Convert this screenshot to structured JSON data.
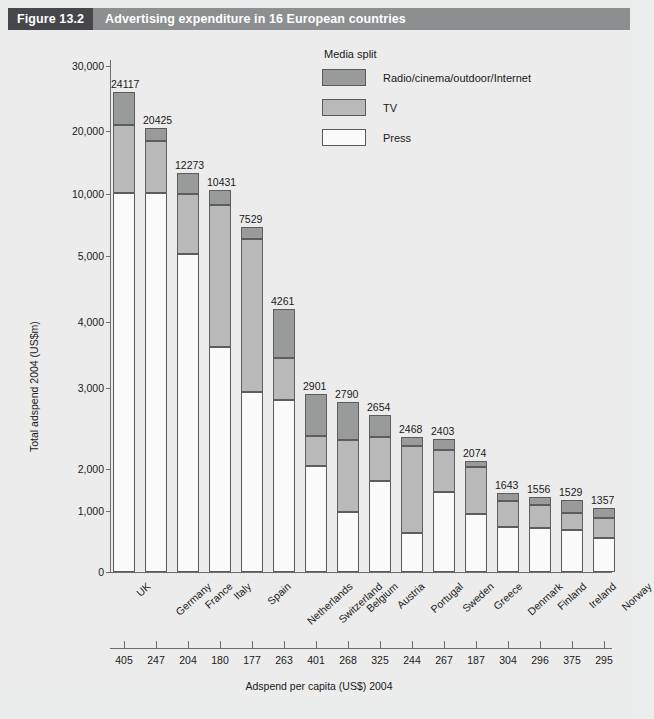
{
  "header": {
    "figure_number": "Figure 13.2",
    "title": "Advertising expenditure in 16 European countries"
  },
  "legend": {
    "title": "Media split",
    "items": [
      {
        "label": "Radio/cinema/outdoor/Internet",
        "color": "#999a9a",
        "key": "radio"
      },
      {
        "label": "TV",
        "color": "#b9b9b9",
        "key": "tv"
      },
      {
        "label": "Press",
        "color": "#fbfbfb",
        "key": "press"
      }
    ]
  },
  "axes": {
    "y_title": "Total adspend 2004 (US$m)",
    "y_ticks": [
      "30,000",
      "20,000",
      "10,000",
      "5,000",
      "4,000",
      "3,000",
      "2,000",
      "1,000",
      "0"
    ],
    "y_tick_values": [
      30000,
      20000,
      10000,
      5000,
      4000,
      3000,
      2000,
      1000,
      0
    ],
    "bottom_title": "Adspend per capita (US$) 2004"
  },
  "chart_data": {
    "type": "bar",
    "stacked": true,
    "title": "Advertising expenditure in 16 European countries",
    "xlabel": "Adspend per capita (US$) 2004",
    "ylabel": "Total adspend 2004 (US$m)",
    "yscale": "log-like (custom piecewise)",
    "ylim": [
      0,
      30000
    ],
    "grid": false,
    "legend_position": "top-right",
    "categories": [
      "UK",
      "Germany",
      "France",
      "Italy",
      "Spain",
      "Netherlands",
      "Switzerland",
      "Belgium",
      "Austria",
      "Portugal",
      "Sweden",
      "Greece",
      "Denmark",
      "Finland",
      "Ireland",
      "Norway"
    ],
    "totals": [
      24117,
      20425,
      12273,
      10431,
      7529,
      4261,
      2901,
      2790,
      2654,
      2468,
      2403,
      2074,
      1643,
      1556,
      1529,
      1357
    ],
    "adspend_per_capita": [
      405,
      247,
      204,
      180,
      177,
      263,
      401,
      268,
      325,
      244,
      267,
      187,
      304,
      296,
      375,
      295
    ],
    "series": [
      {
        "name": "Press",
        "key": "press",
        "color": "#fbfbfb",
        "values": [
          12000,
          11700,
          5250,
          3600,
          2800,
          2600,
          1700,
          1000,
          1430,
          640,
          1300,
          980,
          740,
          780,
          700,
          570
        ]
      },
      {
        "name": "TV",
        "key": "tv",
        "color": "#b9b9b9",
        "values": [
          5800,
          5600,
          4400,
          5300,
          3800,
          920,
          620,
          1320,
          730,
          1720,
          740,
          930,
          680,
          570,
          540,
          620
        ]
      },
      {
        "name": "Radio/cinema/outdoor/Internet",
        "key": "radio",
        "color": "#999a9a",
        "values": [
          6317,
          3125,
          2623,
          1531,
          929,
          741,
          581,
          470,
          494,
          108,
          363,
          164,
          223,
          206,
          289,
          167
        ]
      }
    ]
  },
  "bars": [
    {
      "country": "UK",
      "total_label": "24117",
      "per_capita": "405",
      "geom": {
        "left": 113,
        "width": 22,
        "press_top": 193,
        "tv_top": 125,
        "radio_top": 92
      }
    },
    {
      "country": "Germany",
      "total_label": "20425",
      "per_capita": "247",
      "geom": {
        "left": 145,
        "width": 22,
        "press_top": 193,
        "tv_top": 141,
        "radio_top": 128
      }
    },
    {
      "country": "France",
      "total_label": "12273",
      "per_capita": "204",
      "geom": {
        "left": 177,
        "width": 22,
        "press_top": 254,
        "tv_top": 194,
        "radio_top": 173
      }
    },
    {
      "country": "Italy",
      "total_label": "10431",
      "per_capita": "180",
      "geom": {
        "left": 209,
        "width": 22,
        "press_top": 347,
        "tv_top": 205,
        "radio_top": 190
      }
    },
    {
      "country": "Spain",
      "total_label": "7529",
      "per_capita": "177",
      "geom": {
        "left": 241,
        "width": 22,
        "press_top": 392,
        "tv_top": 239,
        "radio_top": 227
      }
    },
    {
      "country": "Netherlands",
      "total_label": "4261",
      "per_capita": "263",
      "geom": {
        "left": 273,
        "width": 22,
        "press_top": 400,
        "tv_top": 358,
        "radio_top": 309
      }
    },
    {
      "country": "Switzerland",
      "total_label": "2901",
      "per_capita": "401",
      "geom": {
        "left": 305,
        "width": 22,
        "press_top": 466,
        "tv_top": 436,
        "radio_top": 394
      }
    },
    {
      "country": "Belgium",
      "total_label": "2790",
      "per_capita": "268",
      "geom": {
        "left": 337,
        "width": 22,
        "press_top": 512,
        "tv_top": 440,
        "radio_top": 402
      }
    },
    {
      "country": "Austria",
      "total_label": "2654",
      "per_capita": "325",
      "geom": {
        "left": 369,
        "width": 22,
        "press_top": 481,
        "tv_top": 437,
        "radio_top": 415
      }
    },
    {
      "country": "Portugal",
      "total_label": "2468",
      "per_capita": "244",
      "geom": {
        "left": 401,
        "width": 22,
        "press_top": 533,
        "tv_top": 446,
        "radio_top": 437
      }
    },
    {
      "country": "Sweden",
      "total_label": "2403",
      "per_capita": "267",
      "geom": {
        "left": 433,
        "width": 22,
        "press_top": 492,
        "tv_top": 450,
        "radio_top": 439
      }
    },
    {
      "country": "Greece",
      "total_label": "2074",
      "per_capita": "187",
      "geom": {
        "left": 465,
        "width": 22,
        "press_top": 514,
        "tv_top": 467,
        "radio_top": 461
      }
    },
    {
      "country": "Denmark",
      "total_label": "1643",
      "per_capita": "304",
      "geom": {
        "left": 497,
        "width": 22,
        "press_top": 527,
        "tv_top": 501,
        "radio_top": 493
      }
    },
    {
      "country": "Finland",
      "total_label": "1556",
      "per_capita": "296",
      "geom": {
        "left": 529,
        "width": 22,
        "press_top": 528,
        "tv_top": 505,
        "radio_top": 497
      }
    },
    {
      "country": "Ireland",
      "total_label": "1529",
      "per_capita": "375",
      "geom": {
        "left": 561,
        "width": 22,
        "press_top": 530,
        "tv_top": 513,
        "radio_top": 500
      }
    },
    {
      "country": "Norway",
      "total_label": "1357",
      "per_capita": "295",
      "geom": {
        "left": 593,
        "width": 22,
        "press_top": 538,
        "tv_top": 518,
        "radio_top": 508
      }
    }
  ],
  "y_tick_geom": [
    66,
    131,
    194,
    256,
    322,
    388,
    469,
    511,
    572
  ]
}
